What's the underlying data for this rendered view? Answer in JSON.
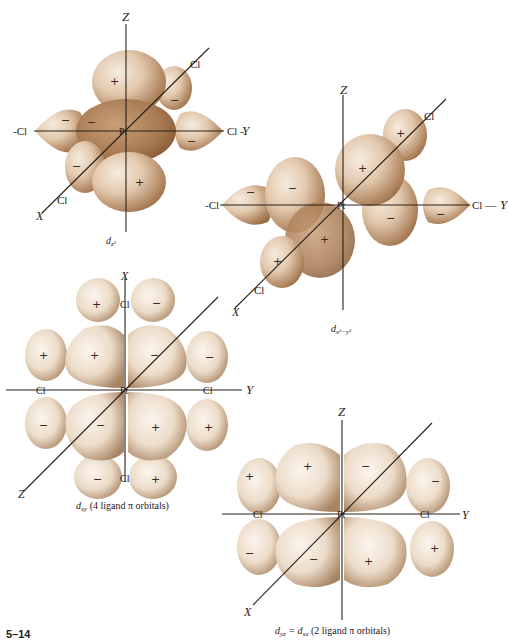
{
  "figure": {
    "number": "5–14",
    "panels": [
      {
        "id": "dz2",
        "caption": "d_z²",
        "caption_main": "d",
        "caption_sub": "z²",
        "metal": "Pt",
        "ligand": "Cl",
        "axes": {
          "z": "Z",
          "y": "Y",
          "x": "X"
        },
        "lobe_signs": [
          "+",
          "−",
          "−",
          "−",
          "−",
          "−",
          "−",
          "+"
        ]
      },
      {
        "id": "dx2-y2",
        "caption": "d_x²−y²",
        "caption_main": "d",
        "caption_sub": "x²−y²",
        "metal": "Pt",
        "ligand": "Cl",
        "axes": {
          "z": "Z",
          "y": "Y",
          "x": "X"
        },
        "lobe_signs": [
          "+",
          "+",
          "−",
          "−",
          "−",
          "−",
          "+",
          "+"
        ]
      },
      {
        "id": "dxy",
        "caption": "d_xy (4 ligand π orbitals)",
        "caption_main": "d",
        "caption_sub": "xy",
        "caption_rest": " (4 ligand π orbitals)",
        "metal": "Pt",
        "ligand": "Cl",
        "axes": {
          "x": "X",
          "y": "Y",
          "z": "Z"
        },
        "lobe_signs": [
          "+",
          "−",
          "+",
          "+",
          "−",
          "−",
          "−",
          "−",
          "+",
          "+",
          "−",
          "+"
        ]
      },
      {
        "id": "dyz-dxz",
        "caption": "d_yz = d_xz (2 ligand π orbitals)",
        "caption_main": "d",
        "caption_sub": "yz",
        "caption_eq": " = d",
        "caption_sub2": "xz",
        "caption_rest": " (2 ligand π orbitals)",
        "metal": "Pt",
        "ligand": "Cl",
        "axes": {
          "z": "Z",
          "y": "Y",
          "x": "X"
        },
        "lobe_signs": [
          "+",
          "+",
          "−",
          "−",
          "−",
          "−",
          "+",
          "+"
        ]
      }
    ]
  },
  "colors": {
    "lobe_dark": "#8a5a32",
    "lobe_mid": "#b98a62",
    "lobe_light": "#f3e6d8",
    "axis": "#2a2018",
    "background": "#ffffff"
  }
}
